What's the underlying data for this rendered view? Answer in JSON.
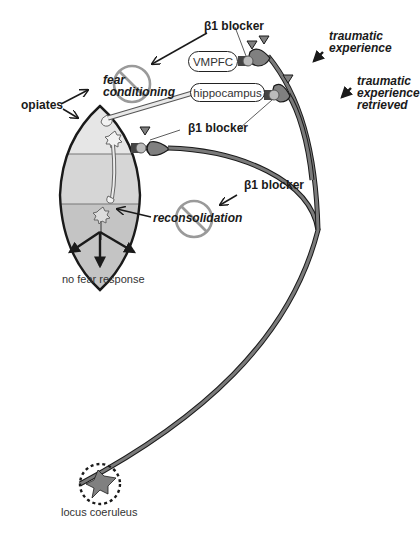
{
  "labels": {
    "beta_blocker_top": "β1 blocker",
    "beta_blocker_mid": "β1 blocker",
    "beta_blocker_low": "β1 blocker",
    "fear_conditioning_line1": "fear",
    "fear_conditioning_line2": "conditioning",
    "opiates": "opiates",
    "traumatic_experience_line1": "traumatic",
    "traumatic_experience_line2": "experience",
    "traumatic_retrieved_line1": "traumatic",
    "traumatic_retrieved_line2": "experience",
    "traumatic_retrieved_line3": "retrieved",
    "reconsolidation": "reconsolidation",
    "no_fear_response": "no fear response",
    "locus_coeruleus": "locus coeruleus"
  },
  "boxes": {
    "vmpfc": "VMPFC",
    "hippocampus": "hippocampus"
  },
  "colors": {
    "stroke": "#1a1a1a",
    "axon_fill": "#7a7a7a",
    "neuron_fill": "#808080",
    "amygdala_top": "#e6e6e6",
    "amygdala_mid": "#d6d6d6",
    "amygdala_bottom": "#c4c4c4",
    "prohibit": "#9a9a9a"
  }
}
